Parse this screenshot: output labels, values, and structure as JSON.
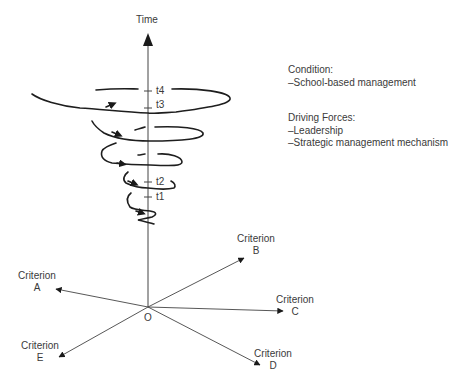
{
  "axis": {
    "vertical_label": "Time",
    "origin_label": "O",
    "time_ticks": [
      "t1",
      "t2",
      "t3",
      "t4"
    ]
  },
  "criteria": [
    {
      "line1": "Criterion",
      "line2": "A"
    },
    {
      "line1": "Criterion",
      "line2": "B"
    },
    {
      "line1": "Criterion",
      "line2": "C"
    },
    {
      "line1": "Criterion",
      "line2": "D"
    },
    {
      "line1": "Criterion",
      "line2": "E"
    }
  ],
  "legend": {
    "condition_heading": "Condition:",
    "condition_items": [
      "–School-based management"
    ],
    "forces_heading": "Driving Forces:",
    "forces_items": [
      "–Leadership",
      "–Strategic management mechanism"
    ]
  },
  "colors": {
    "line": "#2a2a2a",
    "text": "#3a3a3a"
  }
}
